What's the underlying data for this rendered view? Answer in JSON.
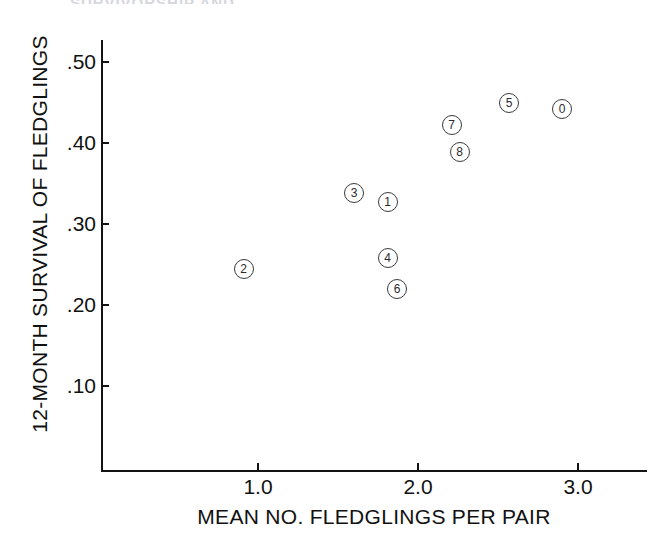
{
  "figure": {
    "cropped_title_text": "SURVIVORSHIP AND",
    "background_color": "#ffffff",
    "ink_color": "#141414"
  },
  "axes": {
    "x_title": "MEAN NO. FLEDGLINGS PER PAIR",
    "y_title": "12-MONTH SURVIVAL OF FLEDGLINGS",
    "x_tick_labels": [
      "1.0",
      "2.0",
      "3.0"
    ],
    "y_tick_labels": [
      ".50",
      ".40",
      ".30",
      ".20",
      ".10"
    ]
  },
  "chart_data": {
    "type": "scatter",
    "title": "",
    "xlabel": "MEAN NO. FLEDGLINGS PER PAIR",
    "ylabel": "12-MONTH SURVIVAL OF FLEDGLINGS",
    "xlim": [
      0.35,
      3.42
    ],
    "ylim": [
      0.02,
      0.545
    ],
    "xticks": [
      1.0,
      2.0,
      3.0
    ],
    "yticks": [
      0.5,
      0.4,
      0.3,
      0.2,
      0.1
    ],
    "xtick_labels": [
      "1.0",
      "2.0",
      "3.0"
    ],
    "ytick_labels": [
      ".50",
      ".40",
      ".30",
      ".20",
      ".10"
    ],
    "grid": false,
    "legend": "none",
    "marker": "open-circle-with-number",
    "points": [
      {
        "label": "0",
        "x": 2.9,
        "y": 0.442
      },
      {
        "label": "1",
        "x": 1.81,
        "y": 0.327
      },
      {
        "label": "2",
        "x": 0.91,
        "y": 0.244
      },
      {
        "label": "3",
        "x": 1.6,
        "y": 0.338
      },
      {
        "label": "4",
        "x": 1.81,
        "y": 0.258
      },
      {
        "label": "5",
        "x": 2.57,
        "y": 0.45
      },
      {
        "label": "6",
        "x": 1.87,
        "y": 0.22
      },
      {
        "label": "7",
        "x": 2.21,
        "y": 0.422
      },
      {
        "label": "8",
        "x": 2.26,
        "y": 0.389
      }
    ]
  }
}
